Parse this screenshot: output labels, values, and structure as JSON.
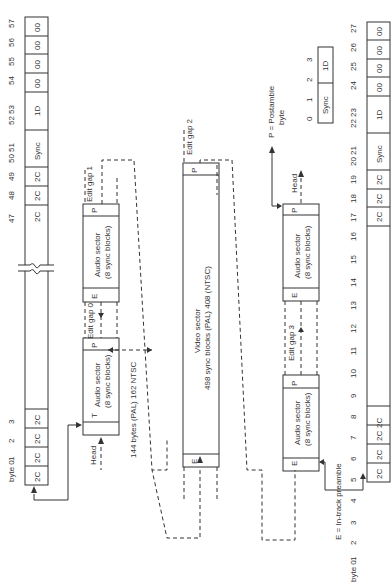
{
  "diagram": {
    "type": "tape-track-format",
    "orientation": "rotated -90deg",
    "top_track": {
      "byte_label": "byte 0",
      "start_bytes": [
        {
          "index": "0",
          "value": "2C"
        },
        {
          "index": "1",
          "value": "2C"
        },
        {
          "index": "2",
          "value": "2C"
        },
        {
          "index": "3",
          "value": "2C"
        }
      ],
      "end_bytes": [
        {
          "index": "47",
          "value": "2C"
        },
        {
          "index": "48",
          "value": "2C"
        },
        {
          "index": "49",
          "value": "2C"
        },
        {
          "index": "50 51",
          "value": "Sync"
        },
        {
          "index": "52 53",
          "value": "1D"
        },
        {
          "index": "54",
          "value": "00"
        },
        {
          "index": "55",
          "value": "00"
        },
        {
          "index": "56",
          "value": "00"
        },
        {
          "index": "57",
          "value": "00"
        }
      ]
    },
    "bottom_track": {
      "byte_label": "byte 0",
      "bytes": [
        {
          "index": "0",
          "value": "2C"
        },
        {
          "index": "1",
          "value": "2C"
        },
        {
          "index": "2",
          "value": "2C"
        },
        {
          "index": "3",
          "value": "2C"
        },
        {
          "index": "4",
          "value": ""
        },
        {
          "index": "5",
          "value": ""
        },
        {
          "index": "6",
          "value": ""
        },
        {
          "index": "7",
          "value": ""
        },
        {
          "index": "8",
          "value": ""
        },
        {
          "index": "9",
          "value": ""
        },
        {
          "index": "10",
          "value": ""
        },
        {
          "index": "11",
          "value": ""
        },
        {
          "index": "12",
          "value": ""
        },
        {
          "index": "13",
          "value": ""
        },
        {
          "index": "14",
          "value": ""
        },
        {
          "index": "15",
          "value": ""
        },
        {
          "index": "16",
          "value": ""
        },
        {
          "index": "17",
          "value": "2C"
        },
        {
          "index": "18",
          "value": "2C"
        },
        {
          "index": "19",
          "value": "2C"
        },
        {
          "index": "20 21",
          "value": "Sync"
        },
        {
          "index": "22 23",
          "value": "1D"
        },
        {
          "index": "24",
          "value": "00"
        },
        {
          "index": "25",
          "value": "00"
        },
        {
          "index": "26",
          "value": "00"
        },
        {
          "index": "27",
          "value": "00"
        }
      ]
    },
    "sync_legend": {
      "indices": [
        "0",
        "1",
        "2",
        "3"
      ],
      "cells": [
        "Sync",
        "1D"
      ]
    },
    "sectors": {
      "audio1": {
        "line1": "Audio sector",
        "line2": "(8 sync blocks)",
        "start": "T",
        "end": "P"
      },
      "audio2": {
        "line1": "Audio sector",
        "line2": "(8 sync blocks)",
        "start": "E",
        "end": "P"
      },
      "video": {
        "line1": "Video sector",
        "line2": "498 sync blocks (PAL) 408 (NTSC)",
        "start": "E",
        "end": "P"
      },
      "audio3": {
        "line1": "Audio sector",
        "line2": "(8 sync blocks)",
        "start": "E",
        "end": "P"
      },
      "audio4": {
        "line1": "Audio sector",
        "line2": "(8 sync blocks)",
        "start": "E",
        "end": "P"
      }
    },
    "labels": {
      "head1": "Head",
      "head2": "Head",
      "edit_gap_0": "Edit gap 0",
      "edit_gap_1": "Edit gap 1",
      "edit_gap_2": "Edit gap 2",
      "edit_gap_3": "Edit gap 3",
      "gap_size": "144 bytes (PAL) 162 NTSC",
      "postamble_legend": "P = Postamble byte",
      "postamble_line1": "P = Postamble",
      "postamble_line2": "byte",
      "preamble_legend": "E = In-track preamble"
    },
    "break_marker": "track-break"
  }
}
